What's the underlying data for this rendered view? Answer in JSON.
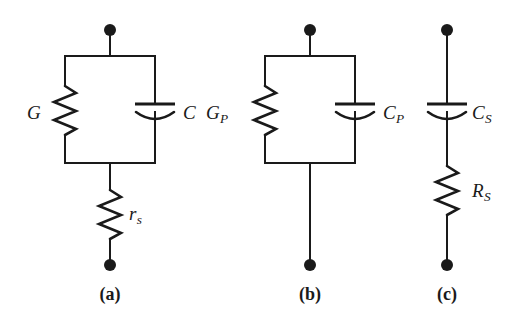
{
  "figure": {
    "background_color": "#ffffff",
    "line_color": "#1a1a1a"
  },
  "circuits": [
    {
      "id": "a",
      "caption": "(a)",
      "topology": "parallel-rc-with-series-resistor",
      "elements": [
        {
          "kind": "resistor",
          "name": "conductance",
          "label_main": "G",
          "label_sub": "",
          "branch": "left-parallel"
        },
        {
          "kind": "capacitor",
          "name": "capacitance",
          "label_main": "C",
          "label_sub": "",
          "branch": "right-parallel"
        },
        {
          "kind": "resistor",
          "name": "series-resistance",
          "label_main": "r",
          "label_sub": "s",
          "branch": "series-bottom"
        }
      ],
      "terminals": [
        "top",
        "bottom"
      ]
    },
    {
      "id": "b",
      "caption": "(b)",
      "topology": "parallel-rc",
      "elements": [
        {
          "kind": "resistor",
          "name": "parallel-conductance",
          "label_main": "G",
          "label_sub": "P",
          "branch": "left-parallel"
        },
        {
          "kind": "capacitor",
          "name": "parallel-capacitance",
          "label_main": "C",
          "label_sub": "P",
          "branch": "right-parallel"
        }
      ],
      "terminals": [
        "top",
        "bottom"
      ]
    },
    {
      "id": "c",
      "caption": "(c)",
      "topology": "series-rc",
      "elements": [
        {
          "kind": "capacitor",
          "name": "series-capacitance",
          "label_main": "C",
          "label_sub": "S",
          "branch": "series"
        },
        {
          "kind": "resistor",
          "name": "series-resistance",
          "label_main": "R",
          "label_sub": "S",
          "branch": "series"
        }
      ],
      "terminals": [
        "top",
        "bottom"
      ]
    }
  ]
}
